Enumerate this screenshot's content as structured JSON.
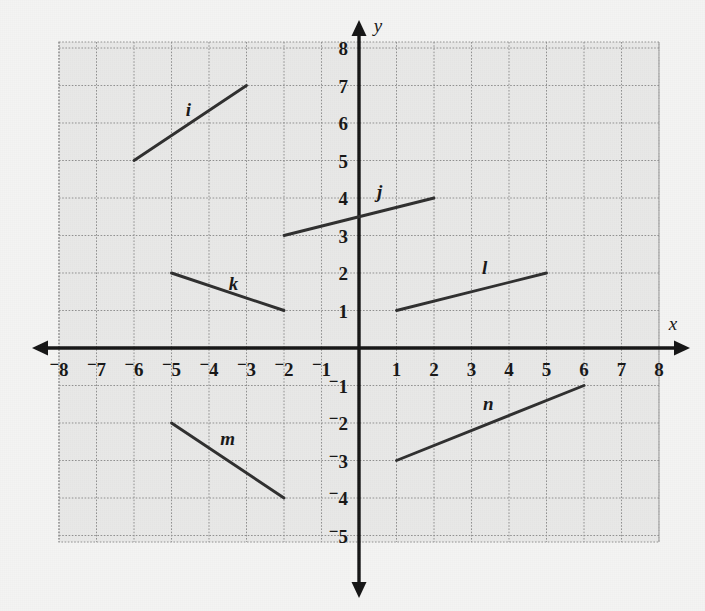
{
  "chart_data": {
    "type": "line",
    "title": "",
    "xlabel": "x",
    "ylabel": "y",
    "xlim": [
      -8,
      8
    ],
    "ylim": [
      -5,
      8
    ],
    "grid": true,
    "legend": "none",
    "x_ticks": [
      "-8",
      "-7",
      "-6",
      "-5",
      "-4",
      "-3",
      "-2",
      "-1",
      "1",
      "2",
      "3",
      "4",
      "5",
      "6",
      "7",
      "8"
    ],
    "y_ticks": [
      "8",
      "7",
      "6",
      "5",
      "4",
      "3",
      "2",
      "1",
      "-1",
      "-2",
      "-3",
      "-4",
      "-5"
    ],
    "x_tick_values": [
      -8,
      -7,
      -6,
      -5,
      -4,
      -3,
      -2,
      -1,
      1,
      2,
      3,
      4,
      5,
      6,
      7,
      8
    ],
    "y_tick_values": [
      8,
      7,
      6,
      5,
      4,
      3,
      2,
      1,
      -1,
      -2,
      -3,
      -4,
      -5
    ],
    "series": [
      {
        "name": "i",
        "label": "i",
        "x": [
          -6,
          -3
        ],
        "y": [
          5,
          7
        ],
        "label_x": -4.55,
        "label_y": 6.35,
        "slope": "2/3"
      },
      {
        "name": "j",
        "label": "j",
        "x": [
          -2,
          2
        ],
        "y": [
          3,
          4
        ],
        "label_x": 0.55,
        "label_y": 4.15,
        "slope": "1/4"
      },
      {
        "name": "k",
        "label": "k",
        "x": [
          -5,
          -2
        ],
        "y": [
          2,
          1
        ],
        "label_x": -3.35,
        "label_y": 1.72,
        "slope": "-1/3"
      },
      {
        "name": "l",
        "label": "l",
        "x": [
          1,
          5
        ],
        "y": [
          1,
          2
        ],
        "label_x": 3.35,
        "label_y": 2.14,
        "slope": "1/4"
      },
      {
        "name": "m",
        "label": "m",
        "x": [
          -5,
          -2
        ],
        "y": [
          -2,
          -4
        ],
        "label_x": -3.5,
        "label_y": -2.42,
        "slope": "-2/3"
      },
      {
        "name": "n",
        "label": "n",
        "x": [
          1,
          6
        ],
        "y": [
          -3,
          -1
        ],
        "label_x": 3.45,
        "label_y": -1.5,
        "slope": "2/5"
      }
    ]
  },
  "colors": {
    "page_background": "#f4f4f3",
    "grid_background": "#e8e8e7",
    "gridline": "#8f8f8f",
    "axis": "#121212",
    "segment": "#2c2c2c",
    "text": "#141414"
  },
  "geometry": {
    "origin_px_x": 359,
    "origin_px_y": 348,
    "unit_px": 37.5,
    "grid_left_px": 59,
    "grid_top_px": 42,
    "grid_right_px": 659,
    "grid_bottom_px": 542
  }
}
